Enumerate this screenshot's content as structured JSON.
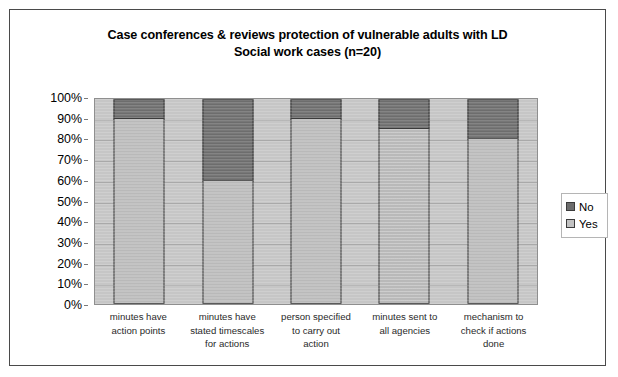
{
  "chart_data": {
    "type": "bar",
    "subtype": "stacked-percent",
    "title": "Case conferences & reviews protection of vulnerable adults with LD",
    "subtitle": "Social work cases (n=20)",
    "xlabel": "",
    "ylabel": "",
    "ylim": [
      0,
      100
    ],
    "grid": true,
    "legend_position": "right",
    "categories": [
      "minutes have action points",
      "minutes have stated timescales for actions",
      "person specified to carry out action",
      "minutes sent to all agencies",
      "mechanism to check if actions done"
    ],
    "category_lines": [
      [
        "minutes have",
        "action points"
      ],
      [
        "minutes have",
        "stated timescales",
        "for actions"
      ],
      [
        "person specified",
        "to carry out",
        "action"
      ],
      [
        "minutes sent to",
        "all agencies"
      ],
      [
        "mechanism to",
        "check if actions",
        "done"
      ]
    ],
    "series": [
      {
        "name": "No",
        "color": "#6d6d6d",
        "values": [
          10,
          40,
          10,
          15,
          20
        ]
      },
      {
        "name": "Yes",
        "color": "#b9b9b9",
        "values": [
          90,
          60,
          90,
          85,
          80
        ]
      }
    ],
    "y_ticks": [
      "100%",
      "90%",
      "80%",
      "70%",
      "60%",
      "50%",
      "40%",
      "30%",
      "20%",
      "10%",
      "0%"
    ],
    "y_tick_values": [
      100,
      90,
      80,
      70,
      60,
      50,
      40,
      30,
      20,
      10,
      0
    ]
  },
  "legend": {
    "items": [
      {
        "label": "No",
        "swatch": "dark-gray-swatch"
      },
      {
        "label": "Yes",
        "swatch": "light-gray-swatch"
      }
    ]
  },
  "colors": {
    "plot_background": "#c6c6c6",
    "gridline": "#a9a9a9",
    "bar_no": "#6d6d6d",
    "bar_yes": "#b9b9b9",
    "bar_outline": "#3b3b3b",
    "frame_border": "#4a4a4a",
    "page_background": "#ffffff",
    "text": "#000000"
  }
}
